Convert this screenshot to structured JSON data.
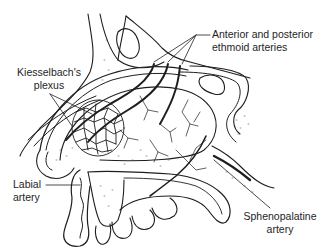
{
  "diagram": {
    "colors": {
      "ink": "#1e1e1e",
      "background": "#ffffff",
      "stipple": "#555555"
    },
    "labels": [
      {
        "id": "ethmoid",
        "lines": [
          "Anterior and posterior",
          "ethmoid arteries"
        ]
      },
      {
        "id": "kiesselbach",
        "lines": [
          "Kiesselbach's",
          "plexus"
        ]
      },
      {
        "id": "labial",
        "lines": [
          "Labial",
          "artery"
        ]
      },
      {
        "id": "sphenopalatine",
        "lines": [
          "Sphenopalatine",
          "artery"
        ]
      }
    ]
  }
}
